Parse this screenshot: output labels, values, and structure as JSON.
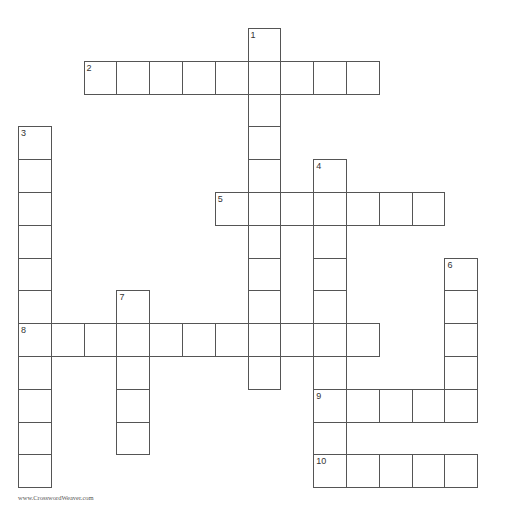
{
  "puzzle": {
    "grid": {
      "origin_x": 18,
      "origin_y": 28,
      "cell_pitch": 32.8,
      "border_color": "#555555"
    },
    "words": [
      {
        "number": 1,
        "direction": "down",
        "row": 0,
        "col": 7,
        "length": 11
      },
      {
        "number": 2,
        "direction": "across",
        "row": 1,
        "col": 2,
        "length": 9
      },
      {
        "number": 3,
        "direction": "down",
        "row": 3,
        "col": 0,
        "length": 11
      },
      {
        "number": 4,
        "direction": "down",
        "row": 4,
        "col": 9,
        "length": 10
      },
      {
        "number": 5,
        "direction": "across",
        "row": 5,
        "col": 6,
        "length": 7
      },
      {
        "number": 6,
        "direction": "down",
        "row": 7,
        "col": 13,
        "length": 5
      },
      {
        "number": 7,
        "direction": "down",
        "row": 8,
        "col": 3,
        "length": 5
      },
      {
        "number": 8,
        "direction": "across",
        "row": 9,
        "col": 0,
        "length": 11
      },
      {
        "number": 9,
        "direction": "across",
        "row": 11,
        "col": 9,
        "length": 5
      },
      {
        "number": 10,
        "direction": "across",
        "row": 13,
        "col": 9,
        "length": 5
      }
    ]
  },
  "footer": {
    "credit": "www.CrosswordWeaver.com"
  }
}
